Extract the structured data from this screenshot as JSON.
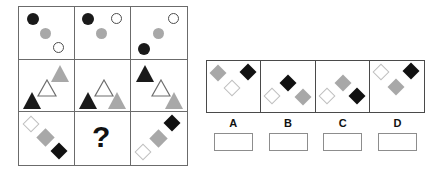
{
  "puzzle": {
    "type": "matrix-reasoning",
    "title": "",
    "matrix": {
      "rows": 3,
      "columns": 3,
      "cells": [
        {
          "id": "r1c1",
          "row": 1,
          "col": 1,
          "shape_type": "circle",
          "shapes": [
            {
              "kind": "circle",
              "fill": "black",
              "size": 12,
              "x": 8,
              "y": 6
            },
            {
              "kind": "circle",
              "fill": "grey",
              "size": 11,
              "x": 21,
              "y": 21
            },
            {
              "kind": "circle",
              "fill": "white",
              "size": 11,
              "x": 34,
              "y": 35
            }
          ]
        },
        {
          "id": "r1c2",
          "row": 1,
          "col": 2,
          "shape_type": "circle",
          "shapes": [
            {
              "kind": "circle",
              "fill": "black",
              "size": 12,
              "x": 7,
              "y": 6
            },
            {
              "kind": "circle",
              "fill": "grey",
              "size": 11,
              "x": 21,
              "y": 21
            },
            {
              "kind": "circle",
              "fill": "white",
              "size": 11,
              "x": 36,
              "y": 6
            }
          ]
        },
        {
          "id": "r1c3",
          "row": 1,
          "col": 3,
          "shape_type": "circle",
          "shapes": [
            {
              "kind": "circle",
              "fill": "white",
              "size": 11,
              "x": 37,
              "y": 6
            },
            {
              "kind": "circle",
              "fill": "grey",
              "size": 11,
              "x": 22,
              "y": 21
            },
            {
              "kind": "circle",
              "fill": "black",
              "size": 12,
              "x": 7,
              "y": 36
            }
          ]
        },
        {
          "id": "r2c1",
          "row": 2,
          "col": 1,
          "shape_type": "triangle",
          "shapes": [
            {
              "kind": "triangle",
              "fill": "grey",
              "size": 18,
              "x": 32,
              "y": 5
            },
            {
              "kind": "triangle",
              "fill": "white",
              "size": 18,
              "x": 18,
              "y": 19
            },
            {
              "kind": "triangle",
              "fill": "black",
              "size": 18,
              "x": 4,
              "y": 32
            }
          ]
        },
        {
          "id": "r2c2",
          "row": 2,
          "col": 2,
          "shape_type": "triangle",
          "shapes": [
            {
              "kind": "triangle",
              "fill": "white",
              "size": 18,
              "x": 19,
              "y": 19
            },
            {
              "kind": "triangle",
              "fill": "black",
              "size": 18,
              "x": 4,
              "y": 32
            },
            {
              "kind": "triangle",
              "fill": "grey",
              "size": 18,
              "x": 33,
              "y": 32
            }
          ]
        },
        {
          "id": "r2c3",
          "row": 2,
          "col": 3,
          "shape_type": "triangle",
          "shapes": [
            {
              "kind": "triangle",
              "fill": "black",
              "size": 18,
              "x": 5,
              "y": 5
            },
            {
              "kind": "triangle",
              "fill": "white",
              "size": 18,
              "x": 20,
              "y": 19
            },
            {
              "kind": "triangle",
              "fill": "grey",
              "size": 18,
              "x": 34,
              "y": 32
            }
          ]
        },
        {
          "id": "r3c1",
          "row": 3,
          "col": 1,
          "shape_type": "diamond",
          "shapes": [
            {
              "kind": "diamond",
              "fill": "white",
              "size": 12,
              "x": 6,
              "y": 6
            },
            {
              "kind": "diamond",
              "fill": "grey",
              "size": 13,
              "x": 20,
              "y": 19
            },
            {
              "kind": "diamond",
              "fill": "black",
              "size": 12,
              "x": 34,
              "y": 33
            }
          ]
        },
        {
          "id": "r3c2",
          "row": 3,
          "col": 2,
          "shape_type": "question",
          "is_question": true,
          "question_mark": "?",
          "shapes": []
        },
        {
          "id": "r3c3",
          "row": 3,
          "col": 3,
          "shape_type": "diamond",
          "shapes": [
            {
              "kind": "diamond",
              "fill": "black",
              "size": 12,
              "x": 35,
              "y": 5
            },
            {
              "kind": "diamond",
              "fill": "grey",
              "size": 13,
              "x": 21,
              "y": 20
            },
            {
              "kind": "diamond",
              "fill": "white",
              "size": 12,
              "x": 6,
              "y": 34
            }
          ]
        }
      ]
    },
    "options": [
      {
        "label": "A",
        "shapes": [
          {
            "kind": "diamond",
            "fill": "grey",
            "size": 12,
            "x": 5,
            "y": 6
          },
          {
            "kind": "diamond",
            "fill": "white",
            "size": 12,
            "x": 19,
            "y": 21
          },
          {
            "kind": "diamond",
            "fill": "black",
            "size": 12,
            "x": 35,
            "y": 5
          }
        ]
      },
      {
        "label": "B",
        "shapes": [
          {
            "kind": "diamond",
            "fill": "black",
            "size": 12,
            "x": 21,
            "y": 16
          },
          {
            "kind": "diamond",
            "fill": "white",
            "size": 12,
            "x": 5,
            "y": 29
          },
          {
            "kind": "diamond",
            "fill": "grey",
            "size": 12,
            "x": 36,
            "y": 30
          }
        ]
      },
      {
        "label": "C",
        "shapes": [
          {
            "kind": "diamond",
            "fill": "grey",
            "size": 12,
            "x": 21,
            "y": 16
          },
          {
            "kind": "diamond",
            "fill": "white",
            "size": 12,
            "x": 5,
            "y": 29
          },
          {
            "kind": "diamond",
            "fill": "black",
            "size": 12,
            "x": 35,
            "y": 29
          }
        ]
      },
      {
        "label": "D",
        "shapes": [
          {
            "kind": "diamond",
            "fill": "white",
            "size": 12,
            "x": 5,
            "y": 5
          },
          {
            "kind": "diamond",
            "fill": "grey",
            "size": 12,
            "x": 20,
            "y": 20
          },
          {
            "kind": "diamond",
            "fill": "black",
            "size": 12,
            "x": 35,
            "y": 4
          }
        ]
      }
    ],
    "answer_boxes": [
      {
        "label": "A",
        "value": ""
      },
      {
        "label": "B",
        "value": ""
      },
      {
        "label": "C",
        "value": ""
      },
      {
        "label": "D",
        "value": ""
      }
    ],
    "colors": {
      "black": "#1a1a1a",
      "grey": "#a8a8a8",
      "white_fill": "#ffffff",
      "white_outline": "#bfbfbf",
      "grid_border": "#6b6b6b",
      "panel_border": "#4a4a4a",
      "box_border": "#8d8d8d",
      "background": "#ffffff"
    }
  }
}
